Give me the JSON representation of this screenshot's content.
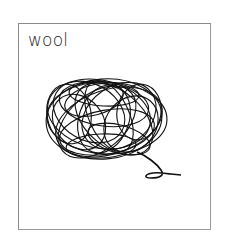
{
  "card": {
    "label": "wool",
    "icon": "wool-ball-icon"
  },
  "colors": {
    "stroke": "#111111",
    "border": "#8a8a8a",
    "background": "#ffffff"
  }
}
